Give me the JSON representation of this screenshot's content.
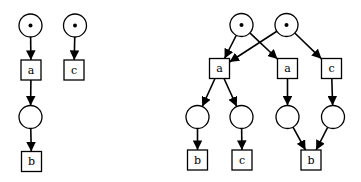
{
  "diagrams": [
    {
      "name": "petri-net",
      "places": [
        {
          "id": "p1",
          "tokens": 1
        },
        {
          "id": "p2",
          "tokens": 1
        },
        {
          "id": "p3",
          "tokens": 0
        }
      ],
      "transitions": [
        {
          "id": "t_a",
          "label": "a"
        },
        {
          "id": "t_c",
          "label": "c"
        },
        {
          "id": "t_b",
          "label": "b"
        }
      ],
      "arcs": [
        [
          "p1",
          "t_a"
        ],
        [
          "p2",
          "t_c"
        ],
        [
          "t_a",
          "p3"
        ],
        [
          "p3",
          "t_b"
        ]
      ]
    },
    {
      "name": "unfolding",
      "places": [
        {
          "id": "q1",
          "tokens": 1
        },
        {
          "id": "q2",
          "tokens": 1
        },
        {
          "id": "q3",
          "tokens": 0
        },
        {
          "id": "q4",
          "tokens": 0
        },
        {
          "id": "q5",
          "tokens": 0
        },
        {
          "id": "q6",
          "tokens": 0
        }
      ],
      "transitions": [
        {
          "id": "u_a1",
          "label": "a"
        },
        {
          "id": "u_a2",
          "label": "a"
        },
        {
          "id": "u_c1",
          "label": "c"
        },
        {
          "id": "u_b1",
          "label": "b"
        },
        {
          "id": "u_c2",
          "label": "c"
        },
        {
          "id": "u_b2",
          "label": "b"
        }
      ],
      "arcs": [
        [
          "q1",
          "u_a1"
        ],
        [
          "q2",
          "u_a1"
        ],
        [
          "q1",
          "u_a2"
        ],
        [
          "q2",
          "u_c1"
        ],
        [
          "u_a1",
          "q3"
        ],
        [
          "u_a1",
          "q4"
        ],
        [
          "u_a2",
          "q5"
        ],
        [
          "u_c1",
          "q6"
        ],
        [
          "q3",
          "u_b1"
        ],
        [
          "q4",
          "u_c2"
        ],
        [
          "q5",
          "u_b2"
        ],
        [
          "q6",
          "u_b2"
        ]
      ]
    }
  ]
}
